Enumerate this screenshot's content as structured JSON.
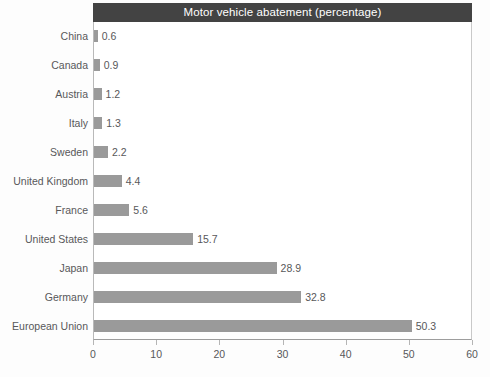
{
  "chart_data": {
    "type": "bar",
    "orientation": "horizontal",
    "title": "Motor vehicle abatement (percentage)",
    "xlabel": "",
    "ylabel": "",
    "xlim": [
      0,
      60
    ],
    "xticks": [
      "0",
      "10",
      "20",
      "30",
      "40",
      "50",
      "60"
    ],
    "grid": false,
    "legend": false,
    "categories": [
      "China",
      "Canada",
      "Austria",
      "Italy",
      "Sweden",
      "United Kingdom",
      "France",
      "United States",
      "Japan",
      "Germany",
      "European Union"
    ],
    "values": [
      0.6,
      0.9,
      1.2,
      1.3,
      2.2,
      4.4,
      5.6,
      15.7,
      28.9,
      32.8,
      50.3
    ],
    "value_labels": [
      "0.6",
      "0.9",
      "1.2",
      "1.3",
      "2.2",
      "4.4",
      "5.6",
      "15.7",
      "28.9",
      "32.8",
      "50.3"
    ],
    "colors": {
      "bar": "#9a9a9a",
      "title_band": "#434343",
      "title_text": "#ffffff",
      "label_text": "#58585a",
      "plot_background": "#ffffff",
      "axis_line": "#9d9d9d"
    }
  }
}
